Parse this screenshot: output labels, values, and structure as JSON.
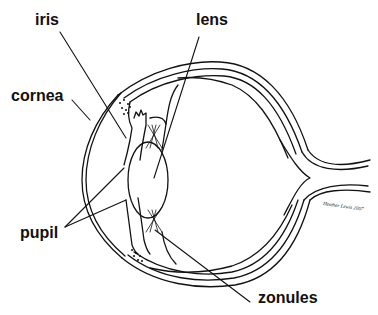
{
  "diagram": {
    "labels": {
      "iris": "iris",
      "lens": "lens",
      "cornea": "cornea",
      "pupil": "pupil",
      "zonules": "zonules"
    },
    "signature": "Heather Lewis 2007",
    "colors": {
      "ink": "#111111",
      "background": "#ffffff"
    }
  }
}
